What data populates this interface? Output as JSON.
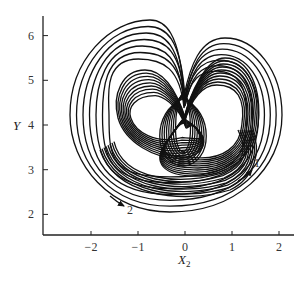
{
  "chart_data": {
    "type": "line",
    "title": "",
    "xlabel": "X",
    "xlabel_subscript": "2",
    "ylabel": "Y",
    "xlim": [
      -3,
      2.3
    ],
    "ylim": [
      1.5,
      6.5
    ],
    "x_ticks": [
      -2,
      -1,
      0,
      1,
      2
    ],
    "x_tick_labels": [
      "−2",
      "−1",
      "0",
      "1",
      "2"
    ],
    "y_ticks": [
      2,
      3,
      4,
      5,
      6
    ],
    "y_tick_labels": [
      "2",
      "3",
      "4",
      "5",
      "6"
    ],
    "grid": false,
    "legend": null,
    "annotations": [
      {
        "text": "1",
        "x": 1.55,
        "y": 3.2,
        "arrow_direction": "up-right"
      },
      {
        "text": "2",
        "x": -1.15,
        "y": 2.1,
        "arrow_direction": "down-right"
      }
    ],
    "series": [
      {
        "name": "trajectory",
        "description": "Nested loops: left lobe centred near (-0.5, 4.2), right lobe centred near (0.6, 4.0), outer envelope spanning X2≈-2.45..2.05, Y≈2.1..6.2",
        "approx_extents": {
          "x_min": -2.45,
          "x_max": 2.05,
          "y_min": 2.1,
          "y_max": 6.2
        },
        "key_points": [
          {
            "label": "outer-left-peak",
            "x": -0.5,
            "y": 6.2
          },
          {
            "label": "outer-right-peak",
            "x": 0.8,
            "y": 5.9
          },
          {
            "label": "central-crossing",
            "x": 0.0,
            "y": 4.0
          },
          {
            "label": "left-lobe-center",
            "x": -0.5,
            "y": 4.2
          },
          {
            "label": "right-lobe-center",
            "x": 0.6,
            "y": 4.0
          },
          {
            "label": "bottom-min",
            "x": -0.3,
            "y": 2.05
          }
        ]
      }
    ]
  },
  "axes": {
    "x_label": "X",
    "x_label_sub": "2",
    "y_label": "Y"
  },
  "annotations": {
    "label_1": "1",
    "label_2": "2"
  }
}
